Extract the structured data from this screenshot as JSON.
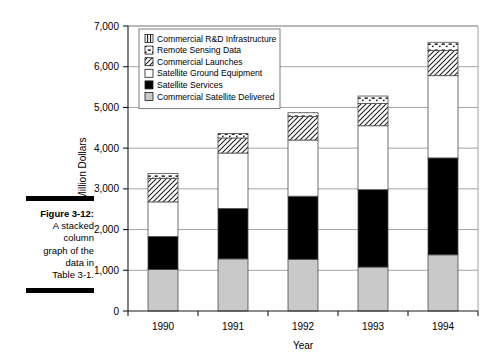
{
  "figure": {
    "caption_number": "Figure 3-12:",
    "caption_body": "A stacked column graph of the data in Table 3-1.",
    "caption_lines": [
      "A stacked",
      "column",
      "graph of the",
      "data in",
      "Table 3-1."
    ]
  },
  "chart_data": {
    "type": "bar",
    "stacked": true,
    "title": "",
    "subtitle": "",
    "xlabel": "Year",
    "ylabel": "Million Dollars",
    "categories": [
      "1990",
      "1991",
      "1992",
      "1993",
      "1994"
    ],
    "ylim": [
      0,
      7000
    ],
    "ytick_step": 1000,
    "ytick_labels": [
      "0",
      "1,000",
      "2,000",
      "3,000",
      "4,000",
      "5,000",
      "6,000",
      "7,000"
    ],
    "ytick_values": [
      0,
      1000,
      2000,
      3000,
      4000,
      5000,
      6000,
      7000
    ],
    "grid": true,
    "grid_axis": "y",
    "legend_position": "top-left-inside",
    "legend_order_top_to_bottom": [
      "Commercial R&D Infrastructure",
      "Remote Sensing Data",
      "Commercial Launches",
      "Satellite Ground Equipment",
      "Satellite Services",
      "Commercial Satellite Delivered"
    ],
    "series": [
      {
        "name": "Commercial Satellite Delivered",
        "fill": "#c9c9c9",
        "pattern": "solid-light-gray",
        "values": [
          1020,
          1280,
          1270,
          1080,
          1380
        ]
      },
      {
        "name": "Satellite Services",
        "fill": "#000000",
        "pattern": "solid-black",
        "values": [
          810,
          1240,
          1550,
          1900,
          2380
        ]
      },
      {
        "name": "Satellite Ground Equipment",
        "fill": "#ffffff",
        "pattern": "solid-white",
        "values": [
          850,
          1360,
          1380,
          1570,
          2020
        ]
      },
      {
        "name": "Commercial Launches",
        "fill": "#ffffff",
        "pattern": "diagonal-hatch",
        "values": [
          580,
          370,
          580,
          550,
          620
        ]
      },
      {
        "name": "Remote Sensing Data",
        "fill": "#ffffff",
        "pattern": "dotted-dash",
        "values": [
          120,
          110,
          90,
          180,
          200
        ]
      },
      {
        "name": "Commercial R&D Infrastructure",
        "fill": "#ffffff",
        "pattern": "vertical-lines",
        "values": [
          0,
          0,
          0,
          0,
          0
        ]
      }
    ],
    "totals": [
      3380,
      4360,
      4870,
      5280,
      6600
    ],
    "segment_tops": [
      [
        1020,
        1830,
        2680,
        3260,
        3380
      ],
      [
        1280,
        2520,
        3880,
        4250,
        4360
      ],
      [
        1270,
        2820,
        4200,
        4780,
        4870
      ],
      [
        1080,
        2980,
        4550,
        5100,
        5280
      ],
      [
        1380,
        3760,
        5780,
        6400,
        6600
      ]
    ]
  }
}
